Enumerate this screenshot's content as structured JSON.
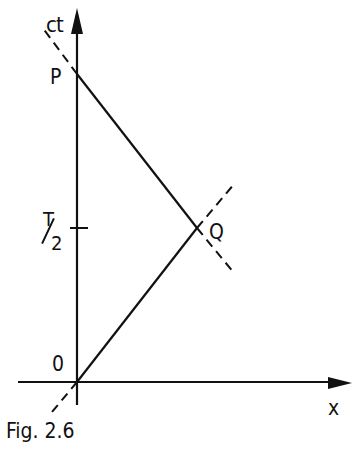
{
  "figure": {
    "caption": "Fig. 2.6",
    "axes": {
      "vertical_label": "ct",
      "horizontal_label": "x"
    },
    "points": {
      "origin": "0",
      "P": "P",
      "Q": "Q"
    },
    "tick": {
      "label_numerator": "T",
      "label_denominator": "2"
    }
  },
  "colors": {
    "ink": "#111111",
    "background": "#ffffff"
  }
}
